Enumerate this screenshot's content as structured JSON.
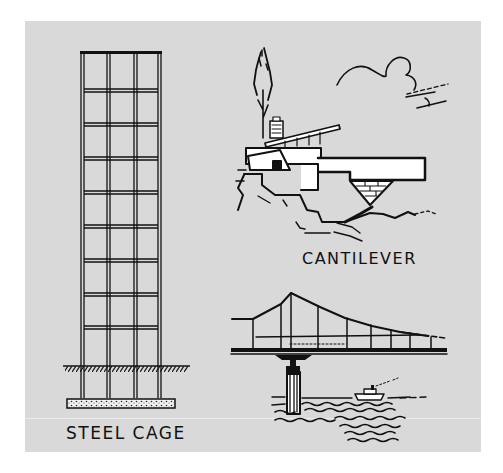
{
  "illustration": {
    "background_color": "#d9d9d9",
    "ink_color": "#111111",
    "panels": [
      {
        "id": "steel-cage",
        "caption": "STEEL CAGE"
      },
      {
        "id": "cantilever",
        "caption": "CANTILEVER"
      },
      {
        "id": "suspension-bridge",
        "caption": ""
      }
    ]
  }
}
